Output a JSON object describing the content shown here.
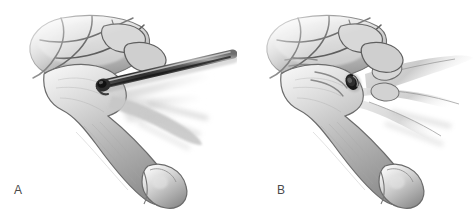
{
  "figure": {
    "kind": "medical-illustration",
    "style": "grayscale pencil/airbrush anatomical drawing",
    "background_color": "#ffffff",
    "width": 474,
    "height": 213,
    "panel_count": 2,
    "ink_color": "#5a5a5a",
    "bone_light": "#f2f2f2",
    "bone_mid": "#c9c9c9",
    "bone_shadow": "#8d8d8d",
    "outline_color": "#6b6b6b",
    "instrument_color": "#3a3a3a",
    "hole_color": "#171717"
  },
  "panels": [
    {
      "id": "a",
      "label": "A",
      "label_x": 14,
      "label_y": 184,
      "description": "Drill guide / K-wire instrument inserted at the base of the metacarpal",
      "has_instrument": true,
      "has_hole": false,
      "instrument": {
        "name": "drill-bit",
        "tip_x": 100,
        "tip_y": 83,
        "tail_x": 232,
        "tail_y": 52,
        "thickness": 9,
        "color": "#3a3a3a",
        "highlight_color": "#9a9a9a"
      }
    },
    {
      "id": "b",
      "label": "B",
      "label_x": 40,
      "label_y": 184,
      "description": "Completed drill hole in the metacarpal base after instrument removal",
      "has_instrument": false,
      "has_hole": true,
      "hole": {
        "name": "drill-hole",
        "cx": 115,
        "cy": 82,
        "rx": 6,
        "ry": 8,
        "rotation": -24,
        "color": "#171717"
      }
    }
  ],
  "anatomy": {
    "carpal_bones_visible": 6,
    "metacarpals_visible": 4,
    "primary_metacarpal": "thumb/first metacarpal shaft with rounded distal head",
    "fade_edges": true
  }
}
